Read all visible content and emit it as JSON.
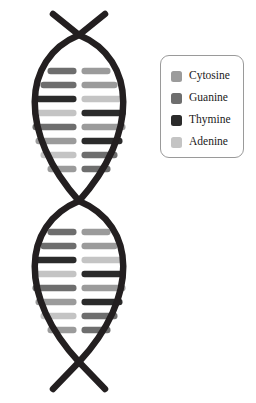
{
  "diagram": {
    "type": "dna-double-helix",
    "background_color": "#ffffff",
    "strand_color": "#231f20",
    "strand_width": 6.5,
    "helix": {
      "center_x": 79,
      "left_x": 19,
      "right_x": 139,
      "top_y": 14,
      "bottom_y": 389,
      "crossover_top_y": 35,
      "crossover_middle_y": 201,
      "crossover_bottom_y": 362,
      "lobes": 2
    },
    "colors": {
      "cytosine": "#9b9b9b",
      "guanine": "#6e6e6e",
      "thymine": "#2b2b2b",
      "adenine": "#c4c4c4"
    },
    "rung": {
      "height": 6.5,
      "gap": 5,
      "radius": 3
    },
    "upper_lobe_rungs": [
      {
        "left": "guanine",
        "right": "cytosine",
        "y": 71,
        "half_width": 29
      },
      {
        "left": "guanine",
        "right": "cytosine",
        "y": 85,
        "half_width": 36
      },
      {
        "left": "thymine",
        "right": "adenine",
        "y": 99,
        "half_width": 41
      },
      {
        "left": "adenine",
        "right": "thymine",
        "y": 113,
        "half_width": 44
      },
      {
        "left": "guanine",
        "right": "cytosine",
        "y": 127,
        "half_width": 44
      },
      {
        "left": "cytosine",
        "right": "thymine",
        "y": 141,
        "half_width": 41
      },
      {
        "left": "adenine",
        "right": "guanine",
        "y": 155,
        "half_width": 36
      },
      {
        "left": "cytosine",
        "right": "guanine",
        "y": 169,
        "half_width": 29
      }
    ],
    "lower_lobe_rungs": [
      {
        "left": "guanine",
        "right": "cytosine",
        "y": 232,
        "half_width": 29
      },
      {
        "left": "guanine",
        "right": "cytosine",
        "y": 246,
        "half_width": 36
      },
      {
        "left": "thymine",
        "right": "adenine",
        "y": 260,
        "half_width": 41
      },
      {
        "left": "adenine",
        "right": "thymine",
        "y": 274,
        "half_width": 44
      },
      {
        "left": "guanine",
        "right": "cytosine",
        "y": 288,
        "half_width": 44
      },
      {
        "left": "cytosine",
        "right": "thymine",
        "y": 302,
        "half_width": 41
      },
      {
        "left": "adenine",
        "right": "guanine",
        "y": 316,
        "half_width": 36
      },
      {
        "left": "cytosine",
        "right": "guanine",
        "y": 330,
        "half_width": 29
      }
    ]
  },
  "legend": {
    "border_color": "#9a9a9a",
    "items": [
      {
        "label": "Cytosine",
        "color": "#9b9b9b",
        "key": "cytosine"
      },
      {
        "label": "Guanine",
        "color": "#6e6e6e",
        "key": "guanine"
      },
      {
        "label": "Thymine",
        "color": "#2b2b2b",
        "key": "thymine"
      },
      {
        "label": "Adenine",
        "color": "#c4c4c4",
        "key": "adenine"
      }
    ]
  }
}
